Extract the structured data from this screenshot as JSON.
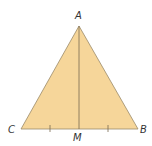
{
  "diagram": {
    "type": "isosceles-triangle-with-median",
    "fill_color": "#F6D69A",
    "stroke_color": "#8a7a60",
    "vertices": {
      "A": {
        "label": "A",
        "x": 79,
        "y": 26
      },
      "B": {
        "label": "B",
        "x": 138,
        "y": 129
      },
      "C": {
        "label": "C",
        "x": 21,
        "y": 129
      }
    },
    "midpoint": {
      "label": "M",
      "x": 79,
      "y": 129
    },
    "segments": [
      "AB",
      "AC",
      "CB",
      "AM"
    ],
    "tick_marks": [
      "CM",
      "MB"
    ]
  }
}
